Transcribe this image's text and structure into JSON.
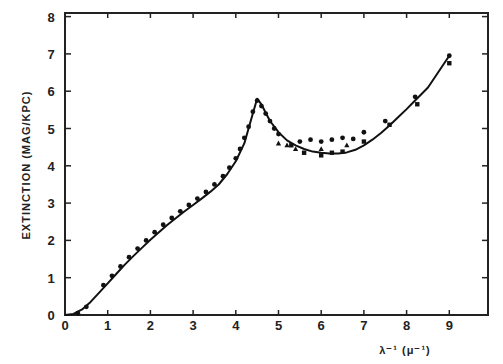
{
  "chart_data": {
    "type": "line",
    "title": "",
    "xlabel": "λ⁻¹ (μ⁻¹)",
    "ylabel": "EXTINCTION (MAG/KPC)",
    "xlim": [
      0,
      10
    ],
    "ylim": [
      0,
      8
    ],
    "xticks": [
      0,
      1,
      2,
      3,
      4,
      5,
      6,
      7,
      8,
      9
    ],
    "yticks": [
      0,
      1,
      2,
      3,
      4,
      5,
      6,
      7,
      8
    ],
    "grid": false,
    "legend": null,
    "series": [
      {
        "name": "fit curve",
        "style": "solid-line",
        "x": [
          0.0,
          0.2,
          0.4,
          0.6,
          0.8,
          1.0,
          1.2,
          1.4,
          1.6,
          1.8,
          2.0,
          2.2,
          2.4,
          2.6,
          2.8,
          3.0,
          3.2,
          3.4,
          3.6,
          3.8,
          4.0,
          4.2,
          4.35,
          4.5,
          4.6,
          4.7,
          4.8,
          5.0,
          5.2,
          5.4,
          5.6,
          5.8,
          6.0,
          6.2,
          6.4,
          6.6,
          6.8,
          7.0,
          7.2,
          7.4,
          7.6,
          7.8,
          8.0,
          8.2,
          8.5,
          9.0
        ],
        "y": [
          0.0,
          0.03,
          0.15,
          0.35,
          0.6,
          0.85,
          1.1,
          1.35,
          1.58,
          1.8,
          2.02,
          2.22,
          2.42,
          2.6,
          2.78,
          2.95,
          3.12,
          3.3,
          3.5,
          3.78,
          4.12,
          4.6,
          5.2,
          5.8,
          5.65,
          5.42,
          5.2,
          4.9,
          4.68,
          4.55,
          4.45,
          4.38,
          4.35,
          4.33,
          4.33,
          4.36,
          4.43,
          4.55,
          4.7,
          4.88,
          5.08,
          5.3,
          5.52,
          5.75,
          6.1,
          6.95
        ]
      },
      {
        "name": "observed (dots)",
        "style": "circle-markers",
        "x": [
          0.3,
          0.5,
          0.9,
          1.1,
          1.3,
          1.5,
          1.7,
          1.9,
          2.1,
          2.3,
          2.5,
          2.7,
          2.9,
          3.1,
          3.3,
          3.5,
          3.7,
          3.85,
          4.0,
          4.1,
          4.2,
          4.3,
          4.4,
          4.5,
          4.6,
          4.7,
          4.8,
          4.9,
          5.0,
          5.5,
          5.75,
          6.0,
          6.25,
          6.5,
          6.75,
          7.0,
          7.5,
          8.2,
          9.0
        ],
        "y": [
          0.05,
          0.22,
          0.8,
          1.05,
          1.3,
          1.55,
          1.78,
          2.0,
          2.22,
          2.42,
          2.6,
          2.78,
          2.95,
          3.12,
          3.3,
          3.5,
          3.72,
          3.95,
          4.2,
          4.45,
          4.75,
          5.05,
          5.45,
          5.75,
          5.6,
          5.4,
          5.2,
          5.0,
          4.85,
          4.65,
          4.7,
          4.65,
          4.7,
          4.75,
          4.72,
          4.9,
          5.2,
          5.85,
          6.95
        ]
      },
      {
        "name": "observed (squares)",
        "style": "square-markers",
        "x": [
          5.3,
          5.6,
          6.0,
          6.25,
          6.5,
          7.0,
          7.6,
          8.25,
          9.0
        ],
        "y": [
          4.55,
          4.35,
          4.28,
          4.35,
          4.38,
          4.65,
          5.1,
          5.65,
          6.75
        ]
      },
      {
        "name": "observed (triangles)",
        "style": "triangle-markers",
        "x": [
          5.0,
          5.2,
          5.4,
          6.0,
          6.6
        ],
        "y": [
          4.6,
          4.55,
          4.45,
          4.45,
          4.55
        ]
      }
    ]
  }
}
